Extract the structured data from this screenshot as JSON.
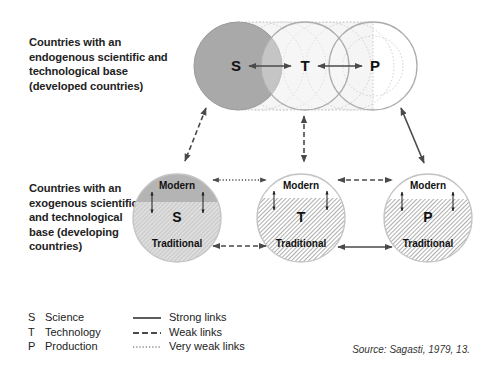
{
  "labels": {
    "developed": [
      "Countries with an",
      "endogenous scientific and",
      "technological base",
      "(developed countries)"
    ],
    "developing": [
      "Countries with an",
      "exogenous scientific",
      "and technological",
      "base (developing",
      "countries)"
    ]
  },
  "top_row": {
    "nodes": [
      {
        "letter": "S",
        "cx": 238,
        "cy": 66,
        "fill": "#a9a9a9"
      },
      {
        "letter": "T",
        "cx": 305,
        "cy": 66,
        "fill": "#f3f3f3"
      },
      {
        "letter": "P",
        "cx": 373,
        "cy": 66,
        "fill": "#ffffff"
      }
    ],
    "radius": 44,
    "links": [
      {
        "from": "S",
        "to": "T",
        "type": "strong"
      },
      {
        "from": "T",
        "to": "P",
        "type": "strong"
      }
    ]
  },
  "bottom_row": {
    "nodes": [
      {
        "letter": "S",
        "cx": 177,
        "cy": 218,
        "modern_label": "Modern",
        "traditional_label": "Traditional",
        "modern_fill": "#b4b4b4",
        "traditional_fill": "#cfcfcf",
        "hatch": "light"
      },
      {
        "letter": "T",
        "cx": 301,
        "cy": 218,
        "modern_label": "Modern",
        "traditional_label": "Traditional",
        "modern_fill": "#ffffff",
        "traditional_fill": "#e6e6e6",
        "hatch": "dense"
      },
      {
        "letter": "P",
        "cx": 428,
        "cy": 218,
        "modern_label": "Modern",
        "traditional_label": "Traditional",
        "modern_fill": "#ffffff",
        "traditional_fill": "#e6e6e6",
        "hatch": "dense"
      }
    ],
    "radius": 44,
    "links": [
      {
        "from": "S-modern",
        "to": "T-modern",
        "type": "very weak"
      },
      {
        "from": "T-modern",
        "to": "P-modern",
        "type": "weak"
      },
      {
        "from": "S-traditional",
        "to": "T-traditional",
        "type": "weak"
      },
      {
        "from": "T-traditional",
        "to": "P-traditional",
        "type": "strong"
      }
    ]
  },
  "vertical_links": [
    {
      "from": "top-S",
      "to": "bottom-S",
      "type": "weak"
    },
    {
      "from": "top-T",
      "to": "bottom-T",
      "type": "weak"
    },
    {
      "from": "top-P",
      "to": "bottom-P",
      "type": "strong"
    }
  ],
  "legend": {
    "codes": [
      {
        "code": "S",
        "label": "Science"
      },
      {
        "code": "T",
        "label": "Technology"
      },
      {
        "code": "P",
        "label": "Production"
      }
    ],
    "links": [
      {
        "style": "solid",
        "label": "Strong links"
      },
      {
        "style": "dashed",
        "label": "Weak links"
      },
      {
        "style": "dotted",
        "label": "Very weak links"
      }
    ]
  },
  "source": "Source: Sagasti, 1979, 13.",
  "colors": {
    "line": "#555555",
    "circle_stroke": "#b0b0b0",
    "text": "#1a1a1a"
  }
}
